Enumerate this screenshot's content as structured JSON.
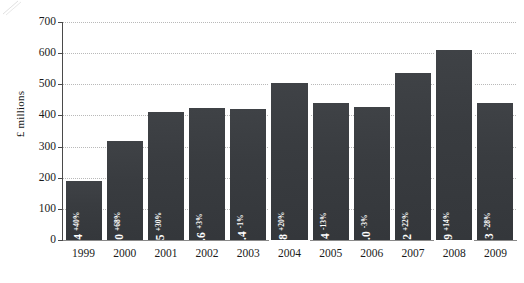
{
  "chart_data": {
    "type": "bar",
    "title": "",
    "xlabel": "",
    "ylabel": "£ millions",
    "ylim": [
      0,
      700
    ],
    "ytick_step": 100,
    "grid": true,
    "legend": "none",
    "categories": [
      "1999",
      "2000",
      "2001",
      "2002",
      "2003",
      "2004",
      "2005",
      "2006",
      "2007",
      "2008",
      "2009"
    ],
    "values": [
      188.4,
      317.0,
      411.5,
      424.6,
      420.4,
      504.8,
      439.4,
      427.0,
      535.2,
      609.9,
      440.3
    ],
    "value_labels": [
      "188.4",
      "317.0",
      "411.5",
      "424.6",
      "420.4",
      "504.8",
      "439.4",
      "427.0",
      "535.2",
      "609.9",
      "440.3"
    ],
    "change_labels": [
      "+40%",
      "+68%",
      "+30%",
      "+3%",
      "-1%",
      "+20%",
      "-13%",
      "-3%",
      "+22%",
      "+14%",
      "-28%"
    ],
    "ytick_labels": [
      "700",
      "600",
      "500",
      "400",
      "300",
      "200",
      "100",
      "0"
    ],
    "ytick_values": [
      700,
      600,
      500,
      400,
      300,
      200,
      100,
      0
    ],
    "highlighted": [
      false,
      false,
      false,
      false,
      false,
      true,
      false,
      false,
      false,
      true,
      false
    ],
    "bar_color": "#3a3d41",
    "highlight_outline_color": "#ffffff",
    "label_color": "#ffffff",
    "grid_color": "#b9b9b9",
    "axis_color": "#4a4a4a",
    "background": "#ffffff"
  }
}
